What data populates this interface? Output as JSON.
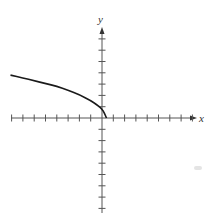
{
  "chart_data": {
    "type": "line",
    "title": "",
    "xlabel": "x",
    "ylabel": "y",
    "xlim": [
      -8.2,
      8
    ],
    "ylim": [
      -8.5,
      8
    ],
    "tick_spacing": 1,
    "x_ticks": [
      -8,
      -7,
      -6,
      -5,
      -4,
      -3,
      -2,
      -1,
      1,
      2,
      3,
      4,
      5,
      6,
      7,
      8
    ],
    "y_ticks": [
      -8,
      -7,
      -6,
      -5,
      -4,
      -3,
      -2,
      -1,
      1,
      2,
      3,
      4,
      5,
      6,
      7
    ],
    "tick_labels_shown": false,
    "grid": false,
    "series": [
      {
        "name": "curve",
        "color": "#1a1a1a",
        "points": [
          [
            -8.1,
            3.8
          ],
          [
            -7,
            3.55
          ],
          [
            -6,
            3.3
          ],
          [
            -5,
            3.05
          ],
          [
            -4,
            2.8
          ],
          [
            -3,
            2.45
          ],
          [
            -2,
            2.05
          ],
          [
            -1,
            1.55
          ],
          [
            -0.5,
            1.2
          ],
          [
            0,
            0.8
          ],
          [
            0.2,
            0.45
          ],
          [
            0.4,
            0
          ]
        ]
      }
    ]
  },
  "axes": {
    "x_label": "x",
    "y_label": "y",
    "axis_color": "#555555",
    "curve_color": "#1a1a1a"
  }
}
